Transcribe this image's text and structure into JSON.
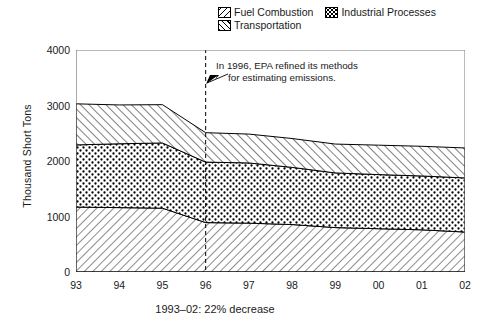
{
  "chart_data": {
    "type": "area",
    "title": "",
    "xlabel": "",
    "ylabel": "Thousand Short Tons",
    "ylim": [
      0,
      4000
    ],
    "yticks": [
      0,
      1000,
      2000,
      3000,
      4000
    ],
    "categories": [
      "93",
      "94",
      "95",
      "96",
      "97",
      "98",
      "99",
      "00",
      "01",
      "02"
    ],
    "stacked": true,
    "stack_order_bottom_to_top": [
      "Fuel Combustion",
      "Industrial Processes",
      "Transportation"
    ],
    "grid": false,
    "legend_position": "top-right",
    "series": [
      {
        "name": "Fuel Combustion",
        "values": [
          1170,
          1160,
          1150,
          890,
          880,
          855,
          800,
          780,
          760,
          720
        ]
      },
      {
        "name": "Industrial Processes",
        "values": [
          1120,
          1150,
          1175,
          1090,
          1085,
          1030,
          985,
          975,
          970,
          975
        ]
      },
      {
        "name": "Transportation",
        "values": [
          740,
          700,
          690,
          530,
          520,
          520,
          520,
          530,
          535,
          540
        ]
      }
    ],
    "cumulative_tops": {
      "fuel_combustion": [
        1170,
        1160,
        1150,
        890,
        880,
        855,
        800,
        780,
        760,
        720
      ],
      "industrial_processes": [
        2290,
        2310,
        2325,
        1980,
        1965,
        1885,
        1785,
        1755,
        1730,
        1695
      ],
      "total": [
        3030,
        3010,
        3015,
        2510,
        2485,
        2405,
        2305,
        2285,
        2265,
        2235
      ]
    },
    "annotations": [
      {
        "name": "epa-methods-note",
        "text_line1": "In 1996, EPA refined its methods",
        "text_line2": "for estimating emissions.",
        "marker_year": "96",
        "marker_style": "dashed-vertical-line-with-arrow"
      }
    ],
    "caption": "1993–02: 22% decrease"
  },
  "legend": {
    "items": [
      {
        "label": "Fuel Combustion",
        "pattern": "diagonal-hatch-left"
      },
      {
        "label": "Industrial Processes",
        "pattern": "dotted-checker"
      },
      {
        "label": "Transportation",
        "pattern": "diagonal-hatch-right"
      }
    ]
  },
  "axes": {
    "y_title": "Thousand Short Tons",
    "y_ticks": [
      "4000",
      "3000",
      "2000",
      "1000",
      "0"
    ],
    "x_ticks": [
      "93",
      "94",
      "95",
      "96",
      "97",
      "98",
      "99",
      "00",
      "01",
      "02"
    ]
  },
  "note": {
    "line1": "In 1996, EPA refined its methods",
    "line2": "for estimating emissions."
  },
  "caption": "1993–02: 22% decrease",
  "colors": {
    "ink": "#000000",
    "background": "#ffffff",
    "frame": "#666666"
  }
}
